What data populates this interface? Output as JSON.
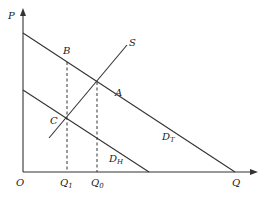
{
  "diagram": {
    "axes": {
      "y_label": "P",
      "x_label": "Q",
      "origin_label": "O"
    },
    "curves": [
      {
        "id": "DT",
        "label_main": "D",
        "label_sub": "T"
      },
      {
        "id": "DH",
        "label_main": "D",
        "label_sub": "H"
      },
      {
        "id": "S",
        "label_main": "S",
        "label_sub": ""
      }
    ],
    "points": {
      "A": "A",
      "B": "B",
      "C": "C"
    },
    "x_ticks": [
      {
        "main": "Q",
        "sub": "1"
      },
      {
        "main": "Q",
        "sub": "0"
      }
    ],
    "colors": {
      "ink": "#333333",
      "background": "#ffffff"
    }
  }
}
